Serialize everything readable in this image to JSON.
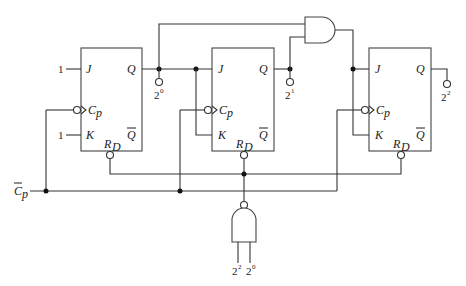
{
  "diagram": {
    "type": "circuit",
    "title": "",
    "flip_flops": [
      {
        "id": "ff0",
        "pins": {
          "j": "J",
          "k": "K",
          "clock": "C",
          "clock_sub": "p",
          "q": "Q",
          "qbar": "Q",
          "reset": "R",
          "reset_sub": "D"
        },
        "j_input": "1",
        "k_input": "1",
        "output_label_base": "2",
        "output_label_exp": "0"
      },
      {
        "id": "ff1",
        "pins": {
          "j": "J",
          "k": "K",
          "clock": "C",
          "clock_sub": "p",
          "q": "Q",
          "qbar": "Q",
          "reset": "R",
          "reset_sub": "D"
        },
        "output_label_base": "2",
        "output_label_exp": "1"
      },
      {
        "id": "ff2",
        "pins": {
          "j": "J",
          "k": "K",
          "clock": "C",
          "clock_sub": "p",
          "q": "Q",
          "qbar": "Q",
          "reset": "R",
          "reset_sub": "D"
        },
        "output_label_base": "2",
        "output_label_exp": "2"
      }
    ],
    "and_gate": {
      "inputs": [
        "2^0",
        "2^1"
      ],
      "output": "ff2.J,K"
    },
    "nand_gate": {
      "inputs_labels": [
        {
          "base": "2",
          "exp": "2"
        },
        {
          "base": "2",
          "exp": "0"
        }
      ],
      "output": "reset"
    },
    "clock_input": {
      "label": "C",
      "sub": "p",
      "overbar": true
    }
  }
}
